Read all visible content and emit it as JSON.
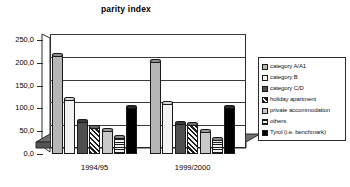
{
  "chart_data": {
    "type": "bar",
    "title": "parity index",
    "xlabel": "",
    "ylabel": "",
    "ylim": [
      0,
      250
    ],
    "ytick_labels": [
      "0,0",
      "50,0",
      "100,0",
      "150,0",
      "200,0",
      "250,0"
    ],
    "ytick_values": [
      0,
      50,
      100,
      150,
      200,
      250
    ],
    "grid": true,
    "legend_position": "right",
    "categories": [
      "1994/95",
      "1999/2000"
    ],
    "series": [
      {
        "name": "category A/A1",
        "fill": "lightgray",
        "values": [
          218,
          205
        ]
      },
      {
        "name": "category B",
        "fill": "white",
        "values": [
          120,
          112
        ]
      },
      {
        "name": "category C/D",
        "fill": "darkgray",
        "values": [
          72,
          69
        ]
      },
      {
        "name": "holiday apartment",
        "fill": "diag",
        "values": [
          60,
          65
        ]
      },
      {
        "name": "private accommodation",
        "fill": "dots",
        "values": [
          52,
          50
        ]
      },
      {
        "name": "others",
        "fill": "hlines",
        "values": [
          37,
          33
        ]
      },
      {
        "name": "Tyrol (i.e. benchmark)",
        "fill": "black",
        "values": [
          103,
          102
        ]
      }
    ]
  },
  "colors": {
    "axis": "#2b2b2b",
    "grid": "#3a3a3a",
    "floor": "#6e6e6e",
    "background": "#ffffff"
  }
}
